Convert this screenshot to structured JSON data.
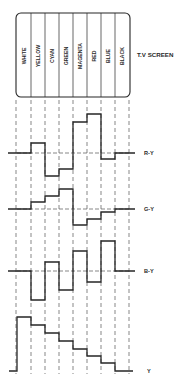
{
  "title": "T.V SCREEN",
  "colors": {
    "ink": "#262626",
    "dash": "#555555"
  },
  "bars": [
    "WHITE",
    "YELLOW",
    "CYAN",
    "GREEN",
    "MAGENTA",
    "RED",
    "BLUE",
    "BLACK"
  ],
  "signals": [
    {
      "name": "R-Y",
      "label": "R-Y",
      "baseline_y": 153,
      "levels_y": [
        153,
        143,
        176,
        169,
        122,
        114,
        159,
        153
      ]
    },
    {
      "name": "G-Y",
      "label": "G-Y",
      "baseline_y": 209,
      "levels_y": [
        209,
        202,
        196,
        189,
        225,
        219,
        212,
        209
      ]
    },
    {
      "name": "B-Y",
      "label": "B-Y",
      "baseline_y": 271,
      "levels_y": [
        271,
        300,
        262,
        290,
        251,
        282,
        241,
        271
      ]
    },
    {
      "name": "Y",
      "label": "Y",
      "baseline_y": 371,
      "levels_y": [
        317,
        325,
        333,
        341,
        349,
        356,
        363,
        371
      ]
    }
  ],
  "chart_data": {
    "type": "line",
    "categories": [
      "WHITE",
      "YELLOW",
      "CYAN",
      "GREEN",
      "MAGENTA",
      "RED",
      "BLUE",
      "BLACK"
    ],
    "series": [
      {
        "name": "R-Y",
        "values": [
          0,
          0.3,
          -0.7,
          -0.5,
          0.9,
          1.2,
          -0.2,
          0
        ]
      },
      {
        "name": "G-Y",
        "values": [
          0,
          0.3,
          0.5,
          0.8,
          -0.6,
          -0.4,
          -0.1,
          0
        ]
      },
      {
        "name": "B-Y",
        "values": [
          0,
          -1.0,
          0.3,
          -0.7,
          0.7,
          -0.4,
          1.0,
          0
        ]
      },
      {
        "name": "Y",
        "values": [
          1.0,
          0.86,
          0.7,
          0.56,
          0.41,
          0.28,
          0.15,
          0
        ]
      }
    ],
    "xlabel": "",
    "ylabel": ""
  }
}
